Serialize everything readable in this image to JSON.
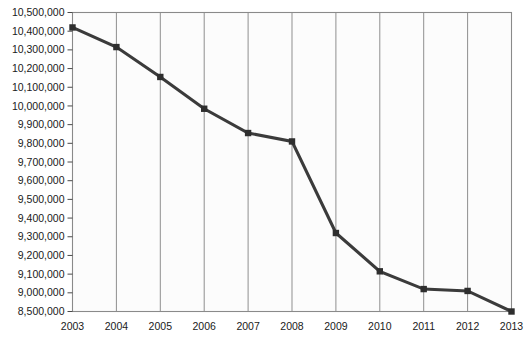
{
  "chart_data": {
    "type": "line",
    "title": "",
    "subtitle": "",
    "xlabel": "",
    "ylabel": "",
    "grid": "vertical-only",
    "legend": "none",
    "categories": [
      "2003",
      "2004",
      "2005",
      "2006",
      "2007",
      "2008",
      "2009",
      "2010",
      "2011",
      "2012",
      "2013"
    ],
    "x": [
      2003,
      2004,
      2005,
      2006,
      2007,
      2008,
      2009,
      2010,
      2011,
      2012,
      2013
    ],
    "values": [
      10420000,
      10315000,
      10155000,
      9985000,
      9855000,
      9810000,
      9320000,
      9115000,
      9020000,
      9010000,
      8500000
    ],
    "series": [
      {
        "name": "",
        "color": "#2e2e2e",
        "marker": "square",
        "values": [
          10420000,
          10315000,
          10155000,
          9985000,
          9855000,
          9810000,
          9320000,
          9115000,
          9020000,
          9010000,
          8500000
        ]
      }
    ],
    "y_tick_labels": [
      "10,500,000",
      "10,400,000",
      "10,300,000",
      "10,200,000",
      "10,100,000",
      "10,000,000",
      "9,900,000",
      "9,800,000",
      "9,700,000",
      "9,600,000",
      "9,500,000",
      "9,400,000",
      "9,300,000",
      "9,200,000",
      "9,100,000",
      "9,000,000",
      "8,500,000"
    ],
    "y_tick_values": [
      10500000,
      10400000,
      10300000,
      10200000,
      10100000,
      10000000,
      9900000,
      9800000,
      9700000,
      9600000,
      9500000,
      9400000,
      9300000,
      9200000,
      9100000,
      9000000,
      8500000
    ],
    "ylim": [
      8500000,
      10500000
    ],
    "xlim": [
      2003,
      2013
    ],
    "axis_note": "y-axis is non-uniform: bottom label jumps from 9,000,000 to 8,500,000 at equal tick spacing",
    "colors": {
      "line": "#2e2e2e",
      "marker": "#2e2e2e",
      "gridline": "#8f8f8f",
      "frame": "#8a8a8a",
      "plot_background": "#fcfcfc",
      "text": "#1a1a1a"
    }
  }
}
